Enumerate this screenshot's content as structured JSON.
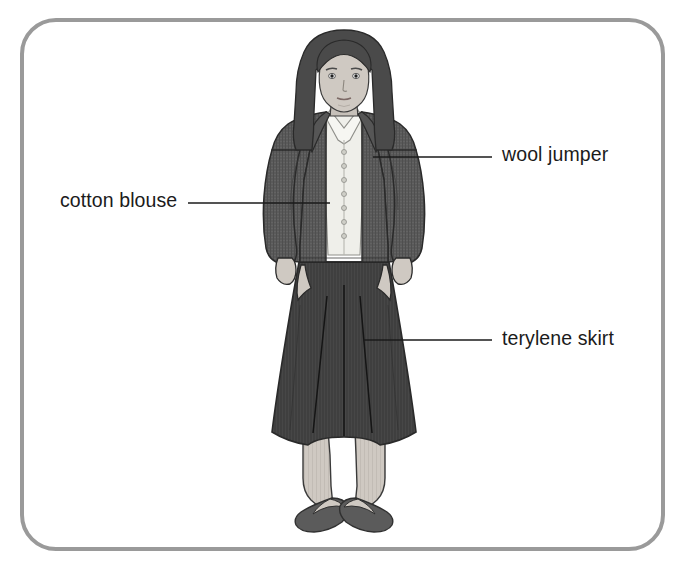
{
  "diagram": {
    "frame": {
      "name": "rounded-frame",
      "border_color": "#9a9a9a",
      "background_color": "#ffffff",
      "corner_radius_px": 36
    },
    "subject": {
      "name": "woman-figure",
      "description": "Front view of a standing woman wearing a jumper, blouse and pleated skirt with flat shoes",
      "colors": {
        "hair": "#4a4a4a",
        "skin": "#cfc9c2",
        "jumper": "#5a5a5a",
        "blouse": "#efefea",
        "skirt": "#3f3f3f",
        "tights": "#cfc9c2",
        "shoes": "#555555",
        "outline": "#2a2a2a"
      }
    },
    "labels": [
      {
        "id": "wool-jumper",
        "text": "wool jumper",
        "side": "right",
        "leader_from_x": 373,
        "leader_from_y": 157,
        "leader_to_x": 492,
        "leader_to_y": 157
      },
      {
        "id": "cotton-blouse",
        "text": "cotton blouse",
        "side": "left",
        "leader_from_x": 330,
        "leader_from_y": 203,
        "leader_to_x": 188,
        "leader_to_y": 203
      },
      {
        "id": "terylene-skirt",
        "text": "terylene skirt",
        "side": "right",
        "leader_from_x": 363,
        "leader_from_y": 340,
        "leader_to_x": 492,
        "leader_to_y": 340
      }
    ]
  }
}
